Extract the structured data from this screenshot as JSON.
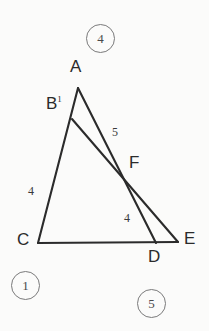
{
  "figure": {
    "kind": "geometry-diagram",
    "width": 209,
    "height": 331,
    "background_color": "#fbfbfa",
    "stroke_color": "#2b2b2b",
    "circle_stroke_color": "#7a7a7a"
  },
  "points": {
    "A": {
      "label": "A",
      "superscript": "",
      "x": 78,
      "y": 88
    },
    "B": {
      "label": "B",
      "superscript": "1",
      "x": 72,
      "y": 119
    },
    "C": {
      "label": "C",
      "superscript": "",
      "x": 38,
      "y": 243
    },
    "D": {
      "label": "D",
      "superscript": "",
      "x": 156,
      "y": 243
    },
    "E": {
      "label": "E",
      "superscript": "",
      "x": 178,
      "y": 242
    },
    "F": {
      "label": "F",
      "superscript": "",
      "x": 124,
      "y": 174
    }
  },
  "vertex_labels": [
    {
      "name": "A",
      "text": "A",
      "superscript": "",
      "left": 70,
      "top": 58
    },
    {
      "name": "B",
      "text": "B",
      "superscript": "1",
      "left": 46,
      "top": 95
    },
    {
      "name": "C",
      "text": "C",
      "superscript": "",
      "left": 17,
      "top": 231
    },
    {
      "name": "D",
      "text": "D",
      "superscript": "",
      "left": 148,
      "top": 248
    },
    {
      "name": "E",
      "text": "E",
      "superscript": "",
      "left": 184,
      "top": 230
    },
    {
      "name": "F",
      "text": "F",
      "superscript": "",
      "left": 129,
      "top": 154
    }
  ],
  "segments": [
    {
      "name": "A-C",
      "from": "A",
      "to": "C"
    },
    {
      "name": "C-E",
      "from": "C",
      "to": "E"
    },
    {
      "name": "A-D",
      "from": "A",
      "to": "D"
    },
    {
      "name": "B-E",
      "from": "B",
      "to": "E"
    }
  ],
  "segment_labels": [
    {
      "name": "label-5-AF",
      "text": "5",
      "left": 112,
      "top": 126
    },
    {
      "name": "label-4-BC",
      "text": "4",
      "left": 28,
      "top": 185
    },
    {
      "name": "label-4-FD",
      "text": "4",
      "left": 124,
      "top": 212
    }
  ],
  "circled_tags": [
    {
      "name": "tag-4-top",
      "text": "4",
      "left": 86,
      "top": 24
    },
    {
      "name": "tag-1-bottom-left",
      "text": "1",
      "left": 11,
      "top": 271
    },
    {
      "name": "tag-5-bottom-right",
      "text": "5",
      "left": 137,
      "top": 289
    }
  ]
}
